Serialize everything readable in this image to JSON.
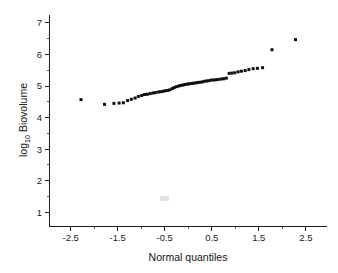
{
  "figure": {
    "background_color": "#ffffff",
    "width": 338,
    "height": 273
  },
  "axes": {
    "x_title": "Normal quantiles",
    "y_title_main": "log",
    "y_title_sub": "10",
    "y_title_rest": " Biovolume",
    "y_title_full": "log10 Biovolume",
    "x_ticklabels": [
      "-2.5",
      "-1.5",
      "-0.5",
      "0.5",
      "1.5",
      "2.5"
    ],
    "x_tickvalues": [
      -2.5,
      -1.5,
      -0.5,
      0.5,
      1.5,
      2.5
    ],
    "x_minor_tickvalues": [
      -2.0,
      -1.0,
      0.0,
      1.0,
      2.0
    ],
    "y_ticklabels": [
      "1",
      "2",
      "3",
      "4",
      "5",
      "6",
      "7"
    ],
    "y_tickvalues": [
      1,
      2,
      3,
      4,
      5,
      6,
      7
    ],
    "axis_color": "#1d1d1d",
    "marker_color": "#101010"
  },
  "chart_data": {
    "type": "scatter",
    "title": "",
    "subtitle": "",
    "xlabel": "Normal quantiles",
    "ylabel": "log10 Biovolume",
    "xlim": [
      -2.95,
      2.95
    ],
    "ylim": [
      0.55,
      7.25
    ],
    "grid": false,
    "legend": null,
    "marker": "filled-square",
    "marker_size_px": 3.0,
    "series": [
      {
        "name": "log10 Biovolume vs normal quantiles",
        "x": [
          -2.28,
          -1.78,
          -1.58,
          -1.47,
          -1.38,
          -1.29,
          -1.21,
          -1.13,
          -1.06,
          -0.99,
          -0.93,
          -0.87,
          -0.81,
          -0.75,
          -0.7,
          -0.64,
          -0.59,
          -0.54,
          -0.49,
          -0.44,
          -0.39,
          -0.34,
          -0.3,
          -0.25,
          -0.2,
          -0.16,
          -0.11,
          -0.07,
          -0.02,
          0.02,
          0.07,
          0.11,
          0.16,
          0.2,
          0.25,
          0.3,
          0.34,
          0.39,
          0.44,
          0.49,
          0.54,
          0.59,
          0.64,
          0.7,
          0.75,
          0.81,
          0.87,
          0.93,
          0.99,
          1.06,
          1.13,
          1.21,
          1.29,
          1.38,
          1.47,
          1.58,
          1.78,
          2.28
        ],
        "y": [
          4.57,
          4.42,
          4.45,
          4.46,
          4.47,
          4.54,
          4.58,
          4.62,
          4.67,
          4.7,
          4.73,
          4.74,
          4.76,
          4.78,
          4.79,
          4.81,
          4.82,
          4.83,
          4.85,
          4.86,
          4.88,
          4.92,
          4.95,
          4.98,
          5.0,
          5.02,
          5.03,
          5.05,
          5.06,
          5.07,
          5.08,
          5.09,
          5.1,
          5.11,
          5.12,
          5.13,
          5.15,
          5.16,
          5.17,
          5.19,
          5.19,
          5.2,
          5.21,
          5.22,
          5.23,
          5.25,
          5.4,
          5.41,
          5.42,
          5.45,
          5.47,
          5.49,
          5.52,
          5.55,
          5.56,
          5.58,
          6.15,
          6.47
        ]
      }
    ]
  }
}
